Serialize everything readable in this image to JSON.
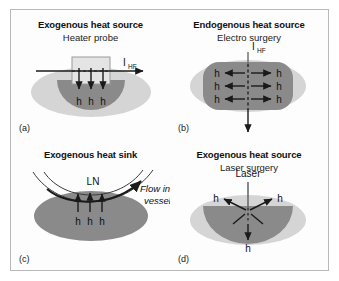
{
  "figure": {
    "background": "#ffffff",
    "frame_color": "#b9b9b9",
    "colors": {
      "tissue_light": "#d5d5d5",
      "tissue_dark": "#8a8a8a",
      "probe_fill": "#e4e4e4",
      "line": "#1a1a1a"
    }
  },
  "panels": [
    {
      "tag": "(a)",
      "title": "Exogenous heat source",
      "subtitle": "Heater probe",
      "current_label": "I",
      "current_subscript": "HF",
      "heat_labels": [
        "h",
        "h",
        "h"
      ]
    },
    {
      "tag": "(b)",
      "title": "Endogenous heat source",
      "subtitle": "Electro surgery",
      "current_label": "I",
      "current_subscript": "HF",
      "heat_labels_left": [
        "h",
        "h",
        "h"
      ],
      "heat_labels_right": [
        "h",
        "h",
        "h"
      ]
    },
    {
      "tag": "(c)",
      "title": "Exogenous heat sink",
      "subtitle": "",
      "vessel_label": "LN",
      "flow_label_line1": "Flow in",
      "flow_label_line2": "vessel",
      "heat_labels": [
        "h",
        "h",
        "h"
      ]
    },
    {
      "tag": "(d)",
      "title": "Exogenous heat source",
      "subtitle": "Laser surgery",
      "source_label": "Laser",
      "heat_labels": [
        "h",
        "h",
        "h"
      ]
    }
  ]
}
